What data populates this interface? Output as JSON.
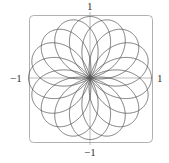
{
  "chart_data": {
    "type": "line",
    "subtype": "polar-rose",
    "title": "",
    "xlabel": "",
    "ylabel": "",
    "equation": "r = cos(8θ/5)",
    "k_numerator": 8,
    "k_denominator": 5,
    "theta_range": [
      0,
      31.4159
    ],
    "petals": 16,
    "xlim": [
      -1,
      1
    ],
    "ylim": [
      -1,
      1
    ],
    "tick_labels": {
      "top": "1",
      "bottom": "−1",
      "left": "−1",
      "right": "1"
    },
    "grid": false,
    "legend": null,
    "frame": "rounded-rect",
    "colors": {
      "curve": "#555555",
      "axes": "#aaaaaa",
      "frame": "#b0b0b0"
    }
  }
}
